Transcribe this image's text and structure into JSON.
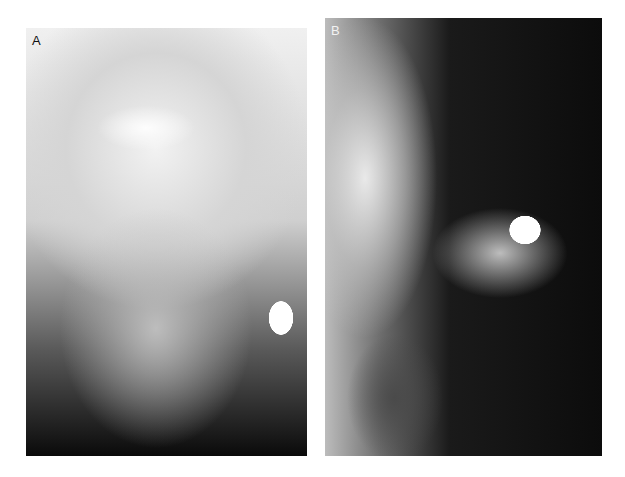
{
  "figure": {
    "panels": [
      {
        "label": "A",
        "description": "Frontal (posteroanterior) skull radiograph with bright round radiopaque object at right mandible angle"
      },
      {
        "label": "B",
        "description": "Lateral skull radiograph with bright round radiopaque object near maxilla/teeth"
      }
    ],
    "colors": {
      "background": "#ffffff",
      "labelA": "#111111",
      "labelB": "#f2f2f2"
    }
  }
}
